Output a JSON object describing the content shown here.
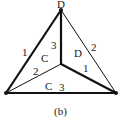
{
  "diagram": {
    "caption": "(b)",
    "colors": {
      "stroke": "#111111",
      "text": "#222222",
      "background": "#ffffff"
    },
    "vertices": [
      {
        "id": "top",
        "label": "D",
        "x": 61,
        "y": 10
      },
      {
        "id": "bottom-left",
        "label": "",
        "x": 6,
        "y": 93
      },
      {
        "id": "bottom-right",
        "label": "",
        "x": 116,
        "y": 93
      },
      {
        "id": "center",
        "label": "",
        "x": 61,
        "y": 64
      }
    ],
    "edges": [
      {
        "from": "top",
        "to": "bottom-left",
        "label": "1",
        "weight": "thick"
      },
      {
        "from": "top",
        "to": "bottom-right",
        "label": "2",
        "weight": "thin"
      },
      {
        "from": "top",
        "to": "center",
        "label": "3",
        "weight": "thick"
      },
      {
        "from": "bottom-left",
        "to": "center",
        "label": "2",
        "weight": "thin"
      },
      {
        "from": "bottom-right",
        "to": "center",
        "label": "1",
        "weight": "thick"
      },
      {
        "from": "bottom-left",
        "to": "bottom-right",
        "label": "3",
        "weight": "thick"
      }
    ],
    "faces": [
      {
        "id": "left-face",
        "label": "C"
      },
      {
        "id": "right-face",
        "label": "D"
      },
      {
        "id": "bottom-face",
        "label": "C"
      }
    ]
  }
}
